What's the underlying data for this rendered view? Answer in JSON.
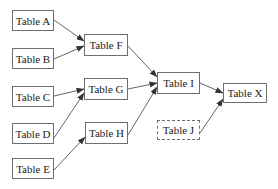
{
  "diagram": {
    "title": "",
    "nodes": [
      {
        "id": "A",
        "label": "Table A",
        "x": 12,
        "y": 10,
        "w": 42,
        "h": 21,
        "style": "solid"
      },
      {
        "id": "B",
        "label": "Table B",
        "x": 12,
        "y": 48,
        "w": 42,
        "h": 21,
        "style": "solid"
      },
      {
        "id": "C",
        "label": "Table C",
        "x": 12,
        "y": 86,
        "w": 42,
        "h": 21,
        "style": "solid"
      },
      {
        "id": "D",
        "label": "Table D",
        "x": 12,
        "y": 123,
        "w": 42,
        "h": 21,
        "style": "solid"
      },
      {
        "id": "E",
        "label": "Table E",
        "x": 12,
        "y": 158,
        "w": 42,
        "h": 21,
        "style": "solid"
      },
      {
        "id": "F",
        "label": "Table F",
        "x": 84,
        "y": 34,
        "w": 44,
        "h": 22,
        "style": "solid"
      },
      {
        "id": "G",
        "label": "Table G",
        "x": 84,
        "y": 78,
        "w": 44,
        "h": 22,
        "style": "solid"
      },
      {
        "id": "H",
        "label": "Table H",
        "x": 85,
        "y": 122,
        "w": 43,
        "h": 22,
        "style": "solid"
      },
      {
        "id": "I",
        "label": "Table I",
        "x": 157,
        "y": 72,
        "w": 43,
        "h": 22,
        "style": "solid"
      },
      {
        "id": "J",
        "label": "Table J",
        "x": 157,
        "y": 120,
        "w": 43,
        "h": 20,
        "style": "dashed"
      },
      {
        "id": "X",
        "label": "Table X",
        "x": 223,
        "y": 83,
        "w": 44,
        "h": 20,
        "style": "solid"
      }
    ],
    "edges": [
      {
        "from": "A",
        "to": "F",
        "x1": 54,
        "y1": 20,
        "x2": 84,
        "y2": 41
      },
      {
        "from": "B",
        "to": "F",
        "x1": 54,
        "y1": 59,
        "x2": 84,
        "y2": 46
      },
      {
        "from": "C",
        "to": "G",
        "x1": 54,
        "y1": 96,
        "x2": 84,
        "y2": 89
      },
      {
        "from": "D",
        "to": "G",
        "x1": 54,
        "y1": 138,
        "x2": 84,
        "y2": 93
      },
      {
        "from": "E",
        "to": "H",
        "x1": 54,
        "y1": 170,
        "x2": 85,
        "y2": 137
      },
      {
        "from": "F",
        "to": "I",
        "x1": 128,
        "y1": 46,
        "x2": 157,
        "y2": 77
      },
      {
        "from": "G",
        "to": "I",
        "x1": 128,
        "y1": 89,
        "x2": 157,
        "y2": 83
      },
      {
        "from": "H",
        "to": "I",
        "x1": 128,
        "y1": 135,
        "x2": 157,
        "y2": 87
      },
      {
        "from": "I",
        "to": "X",
        "x1": 200,
        "y1": 83,
        "x2": 223,
        "y2": 93
      },
      {
        "from": "J",
        "to": "X",
        "x1": 200,
        "y1": 133,
        "x2": 223,
        "y2": 99
      }
    ],
    "colors": {
      "border": "#6e6e6e",
      "edge": "#555555",
      "text": "#222222",
      "background": "#ffffff"
    }
  }
}
